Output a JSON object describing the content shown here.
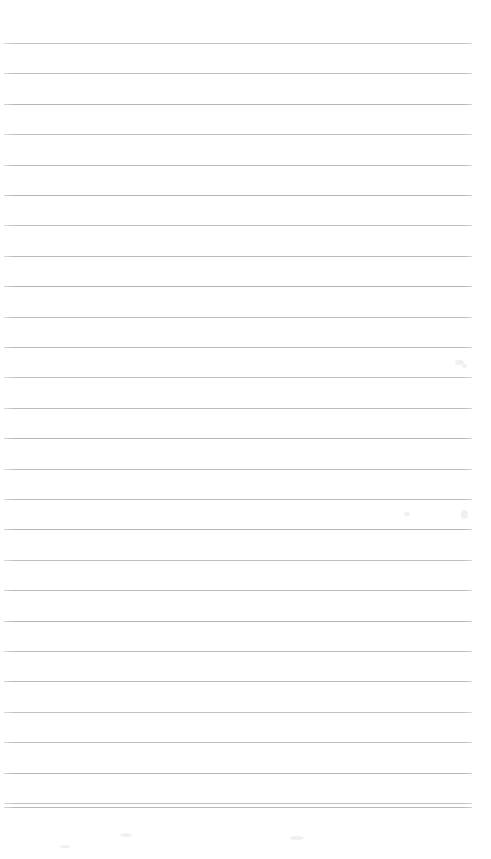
{
  "document": {
    "kind": "scanned-lined-paper",
    "title": "Blank ruled notepad page",
    "page_width": 491,
    "page_height": 859,
    "background_color": "#fefefe",
    "has_text": false,
    "visible_text": "",
    "top_margin_px": 43,
    "bottom_margin_px": 52
  },
  "ruling": {
    "line_count": 27,
    "line_color": "#b4b4b6",
    "line_thickness_px": 1,
    "line_left_x": 4,
    "line_right_x": 472,
    "line_length_px": 468,
    "first_line_y": 43,
    "last_line_y": 807,
    "line_spacing_px": 30.6,
    "line_y_positions": [
      43,
      73.4,
      103.8,
      134.2,
      164.6,
      195,
      225.4,
      255.8,
      286.2,
      316.6,
      347,
      377.4,
      407.8,
      438.2,
      468.6,
      499,
      529.4,
      559.8,
      590.2,
      620.6,
      651,
      681.4,
      711.8,
      742.2,
      772.6,
      803,
      807
    ]
  },
  "artifacts": {
    "description": "faint scanner specks in the right margin",
    "specks": [
      {
        "x": 455,
        "y": 360,
        "w": 9,
        "h": 5
      },
      {
        "x": 462,
        "y": 364,
        "w": 5,
        "h": 4
      },
      {
        "x": 461,
        "y": 510,
        "w": 7,
        "h": 9
      },
      {
        "x": 404,
        "y": 512,
        "w": 6,
        "h": 4
      },
      {
        "x": 120,
        "y": 833,
        "w": 12,
        "h": 4
      },
      {
        "x": 290,
        "y": 836,
        "w": 14,
        "h": 4
      },
      {
        "x": 60,
        "y": 845,
        "w": 10,
        "h": 3
      }
    ]
  }
}
